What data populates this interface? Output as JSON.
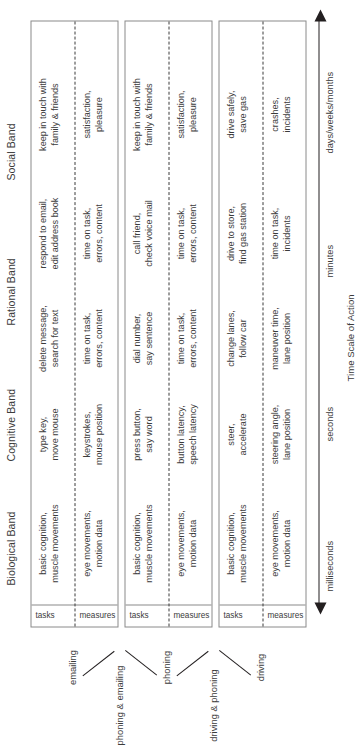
{
  "figure": {
    "axis_title": "Time Scale of Action",
    "bands": [
      {
        "label": "Biological Band"
      },
      {
        "label": "Cognitive Band"
      },
      {
        "label": "Rational Band"
      },
      {
        "label": "Social Band"
      }
    ],
    "axis_ticks": [
      {
        "label": "milliseconds"
      },
      {
        "label": "seconds"
      },
      {
        "label": "minutes"
      },
      {
        "label": "days/weeks/months"
      }
    ],
    "row_labels": {
      "tasks": "tasks",
      "measures": "measures"
    },
    "blocks": [
      {
        "name": "emailing",
        "label": "emailing",
        "tasks": [
          "basic cognition,\nmuscle movements",
          "type key,\nmove mouse",
          "delete message,\nsearch for text",
          "respond to email,\nedit address book",
          "keep in touch with\nfamily & friends"
        ],
        "measures": [
          "eye movements,\nmotion data",
          "keystrokes,\nmouse position",
          "time on task,\nerrors, content",
          "time on task,\nerrors, content",
          "satisfaction,\npleasure"
        ]
      },
      {
        "name": "phoning",
        "label": "phoning",
        "tasks": [
          "basic cognition,\nmuscle movements",
          "press button,\nsay word",
          "dial number,\nsay sentence",
          "call friend,\ncheck voice mail",
          "keep in touch with\nfamily & friends"
        ],
        "measures": [
          "eye movements,\nmotion data",
          "button latency,\nspeech latency",
          "time on task,\nerrors, content",
          "time on task,\nerrors, content",
          "satisfaction,\npleasure"
        ]
      },
      {
        "name": "driving",
        "label": "driving",
        "tasks": [
          "basic cognition,\nmuscle movements",
          "steer,\naccelerate",
          "change lanes,\nfollow car",
          "drive to store,\nfind gas station",
          "drive safely,\nsave gas"
        ],
        "measures": [
          "eye movements,\nmotion data",
          "steering angle,\nlane position",
          "maneuver time,\nlane position",
          "time on task,\nincidents",
          "crashes,\nincidents"
        ]
      }
    ],
    "combinations": [
      {
        "label": "phoning & emailing"
      },
      {
        "label": "driving & phoning"
      }
    ],
    "colors": {
      "text": "#3b3b3b",
      "rule": "#8a8a8a",
      "arrow": "#231f20"
    }
  }
}
